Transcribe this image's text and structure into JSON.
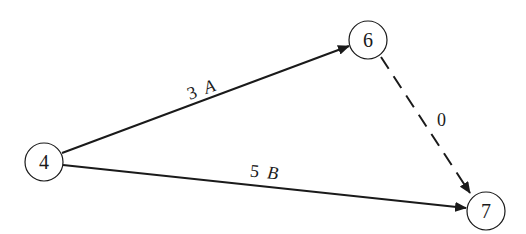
{
  "diagram": {
    "type": "activity-on-arrow network",
    "nodes": [
      {
        "id": "4",
        "label": "4",
        "cx": 44,
        "cy": 162,
        "r": 19
      },
      {
        "id": "6",
        "label": "6",
        "cx": 368,
        "cy": 40,
        "r": 19
      },
      {
        "id": "7",
        "label": "7",
        "cx": 486,
        "cy": 211,
        "r": 19
      }
    ],
    "edges": [
      {
        "from": "4",
        "to": "6",
        "duration": "3",
        "activity": "A",
        "style": "solid"
      },
      {
        "from": "4",
        "to": "7",
        "duration": "5",
        "activity": "B",
        "style": "solid"
      },
      {
        "from": "6",
        "to": "7",
        "duration": "0",
        "activity": "",
        "style": "dashed"
      }
    ]
  },
  "colors": {
    "stroke": "#1a1a1a",
    "background": "#ffffff"
  }
}
